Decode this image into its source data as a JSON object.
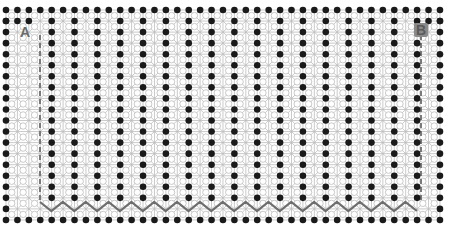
{
  "diagram": {
    "title": "",
    "labels": {
      "a": "A",
      "b": "B"
    },
    "lattice": {
      "x0": 6,
      "y0": 10,
      "dx": 11.42,
      "dy": 11.05,
      "cols": 39,
      "rows": 20,
      "interior_atom_column_stride": 2,
      "interior_atom_first_col": 4
    },
    "colors": {
      "atom": "#1a1a1a",
      "bond": "#bdbdbd",
      "cut_line": "#7a7a7a",
      "zigzag": "#6e6e6e",
      "label": "#6b6b6b"
    },
    "cut_path": {
      "left_x": 40,
      "right_x": 421,
      "top_y": 35,
      "bottom_y": 202,
      "zigzag_y_top": 202,
      "zigzag_y_bottom": 211,
      "zigzag_period": 22.84
    }
  }
}
